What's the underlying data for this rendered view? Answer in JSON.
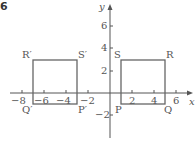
{
  "figure": {
    "number": "6",
    "axis_labels": {
      "x": "x",
      "y": "y"
    },
    "x_ticks": [
      {
        "value": -8,
        "label": "−8"
      },
      {
        "value": -6,
        "label": "−6"
      },
      {
        "value": -4,
        "label": "−4"
      },
      {
        "value": -2,
        "label": "−2"
      },
      {
        "value": 2,
        "label": "2"
      },
      {
        "value": 4,
        "label": "4"
      },
      {
        "value": 6,
        "label": "6"
      }
    ],
    "y_ticks": [
      {
        "value": 6,
        "label": "6"
      },
      {
        "value": 4,
        "label": "4"
      },
      {
        "value": 2,
        "label": "2"
      },
      {
        "value": -2,
        "label": "−2"
      }
    ],
    "shapes": {
      "original": {
        "name": "PQRS",
        "vertices": {
          "P": [
            1,
            -1
          ],
          "Q": [
            5,
            -1
          ],
          "R": [
            5,
            3
          ],
          "S": [
            1,
            3
          ]
        },
        "labels": {
          "P": "P",
          "Q": "Q",
          "R": "R",
          "S": "S"
        }
      },
      "image": {
        "name": "P'Q'R'S'",
        "vertices": {
          "P'": [
            -3,
            -1
          ],
          "Q'": [
            -7,
            -1
          ],
          "R'": [
            -7,
            3
          ],
          "S'": [
            -3,
            3
          ]
        },
        "labels": {
          "P": "P′",
          "Q": "Q′",
          "R": "R′",
          "S": "S′"
        }
      }
    },
    "colors": {
      "axis": "#555555",
      "shape": "#666666",
      "text": "#555555"
    }
  }
}
